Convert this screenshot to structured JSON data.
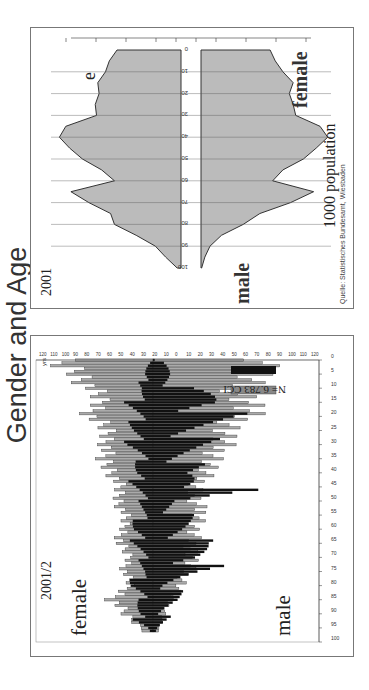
{
  "title": "Gender and Age",
  "left_panel": {
    "year": "2001/2",
    "female_label": "female",
    "male_label": "male",
    "age_unit": "yrs",
    "legend": [
      {
        "label": "N= 6.783 CCI",
        "color": "#888888"
      },
      {
        "label": "258 reha",
        "color": "#111111"
      }
    ],
    "age_ticks": [
      "100",
      "95",
      "90",
      "85",
      "80",
      "75",
      "70",
      "65",
      "60",
      "55",
      "50",
      "45",
      "40",
      "35",
      "30",
      "25",
      "20",
      "15",
      "10",
      "5",
      "0"
    ],
    "count_ticks": [
      "120",
      "110",
      "100",
      "90",
      "80",
      "70",
      "60",
      "50",
      "40",
      "30",
      "20",
      "10",
      "0",
      "10",
      "20",
      "30",
      "40",
      "50",
      "60",
      "70",
      "80",
      "90",
      "100",
      "110",
      "120"
    ]
  },
  "right_panel": {
    "year": "2001",
    "panel_letter": "e",
    "female_label": "female",
    "male_label": "male",
    "age_unit": "yrs",
    "age_ticks": [
      "100",
      "90",
      "80",
      "70",
      "60",
      "50",
      "40",
      "30",
      "20",
      "10",
      "0"
    ],
    "x_ticks": [
      "900",
      "700",
      "500",
      "300",
      "100",
      "100",
      "300",
      "500",
      "700",
      "900"
    ],
    "xlabel": "1000 population",
    "source": "Quelle: Statistisches Bundesamt, Wiesbaden"
  },
  "chart_data": [
    {
      "type": "bar",
      "title": "2001/2",
      "xlabel": "age (yrs)",
      "ylabel": "count",
      "x": [
        0,
        5,
        10,
        15,
        20,
        25,
        30,
        35,
        40,
        45,
        50,
        55,
        60,
        65,
        70,
        75,
        80,
        85,
        90,
        95,
        100
      ],
      "series": [
        {
          "name": "female CCI",
          "values": [
            90,
            65,
            55,
            45,
            55,
            40,
            40,
            45,
            35,
            30,
            30,
            25,
            25,
            30,
            20,
            25,
            20,
            35,
            25,
            10,
            0
          ]
        },
        {
          "name": "male CCI",
          "values": [
            105,
            90,
            75,
            85,
            80,
            65,
            60,
            55,
            45,
            40,
            35,
            45,
            35,
            35,
            35,
            30,
            25,
            15,
            10,
            5,
            0
          ]
        },
        {
          "name": "female reha",
          "values": [
            0,
            10,
            10,
            20,
            15,
            20,
            20,
            10,
            20,
            15,
            10,
            10,
            20,
            15,
            10,
            10,
            20,
            10,
            20,
            5,
            0
          ]
        },
        {
          "name": "male reha",
          "values": [
            5,
            20,
            30,
            85,
            65,
            55,
            45,
            40,
            35,
            90,
            25,
            30,
            40,
            45,
            70,
            40,
            20,
            25,
            15,
            5,
            0
          ]
        }
      ],
      "legend": [
        "N= 6.783 CCI",
        "258 reha"
      ],
      "ylim": [
        -120,
        120
      ]
    },
    {
      "type": "area",
      "title": "2001",
      "xlabel": "1000 population",
      "ylabel": "yrs",
      "x": [
        0,
        5,
        10,
        15,
        20,
        25,
        30,
        35,
        40,
        45,
        50,
        55,
        60,
        65,
        70,
        75,
        80,
        85,
        90,
        95,
        100
      ],
      "series": [
        {
          "name": "female",
          "values": [
            500,
            560,
            590,
            650,
            640,
            670,
            660,
            900,
            950,
            870,
            770,
            620,
            520,
            860,
            720,
            550,
            520,
            350,
            200,
            120,
            30
          ]
        },
        {
          "name": "male",
          "values": [
            540,
            580,
            640,
            720,
            690,
            720,
            740,
            930,
            990,
            900,
            800,
            640,
            560,
            880,
            700,
            460,
            330,
            160,
            70,
            30,
            5
          ]
        }
      ],
      "xlim": [
        -900,
        900
      ]
    }
  ]
}
